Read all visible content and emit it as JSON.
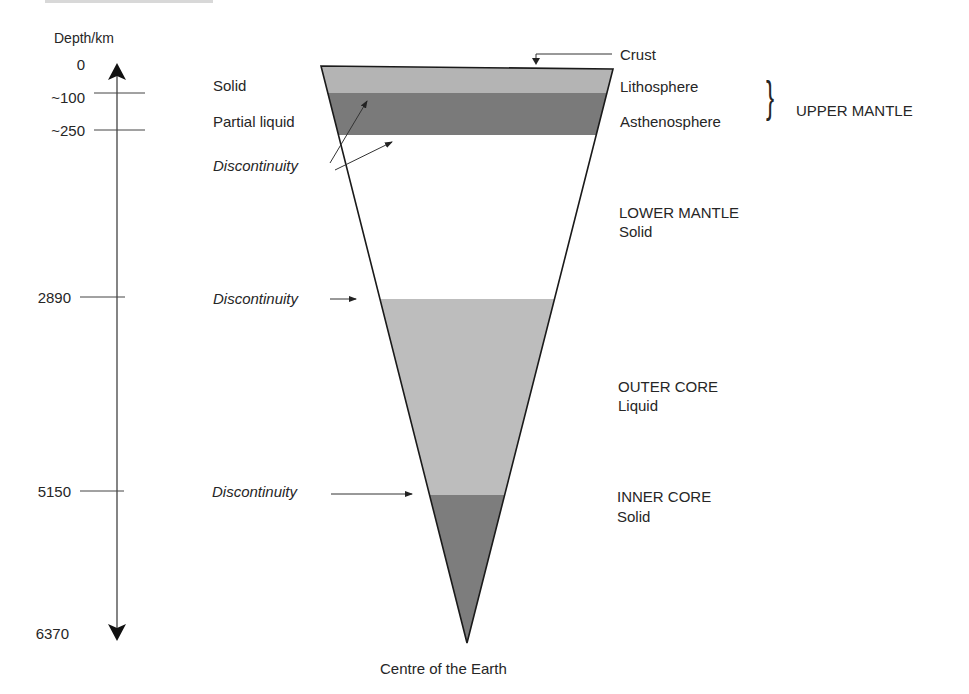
{
  "axis": {
    "title": "Depth/km",
    "ticks": [
      {
        "label": "0",
        "depth_km": 0
      },
      {
        "label": "~100",
        "depth_km": 100
      },
      {
        "label": "~250",
        "depth_km": 250
      },
      {
        "label": "2890",
        "depth_km": 2890
      },
      {
        "label": "5150",
        "depth_km": 5150
      },
      {
        "label": "6370",
        "depth_km": 6370
      }
    ]
  },
  "left_labels": {
    "solid": "Solid",
    "partial_liquid": "Partial liquid",
    "discontinuity_1": "Discontinuity",
    "discontinuity_2": "Discontinuity",
    "discontinuity_3": "Discontinuity"
  },
  "layers": [
    {
      "name": "Crust",
      "state": "",
      "color": "#ffffff"
    },
    {
      "name": "Lithosphere",
      "state": "Solid",
      "color": "#b4b4b4"
    },
    {
      "name": "Asthenosphere",
      "state": "Partial liquid",
      "color": "#7a7a7a"
    },
    {
      "name": "LOWER MANTLE",
      "state": "Solid",
      "color": "#ffffff"
    },
    {
      "name": "OUTER CORE",
      "state": "Liquid",
      "color": "#bdbdbd"
    },
    {
      "name": "INNER CORE",
      "state": "Solid",
      "color": "#7d7d7d"
    }
  ],
  "right_labels": {
    "crust": "Crust",
    "lithosphere": "Lithosphere",
    "asthenosphere": "Asthenosphere",
    "upper_mantle": "UPPER MANTLE",
    "lower_mantle": "LOWER MANTLE",
    "lower_mantle_state": "Solid",
    "outer_core": "OUTER CORE",
    "outer_core_state": "Liquid",
    "inner_core": "INNER CORE",
    "inner_core_state": "Solid"
  },
  "bottom_label": "Centre of the Earth",
  "brace_glyph": "}"
}
